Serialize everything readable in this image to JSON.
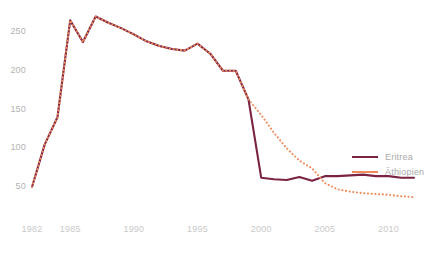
{
  "chart_data": {
    "type": "line",
    "title": "",
    "subtitle": "",
    "xlabel": "",
    "ylabel": "",
    "grid": false,
    "legend_position": "right-inside",
    "x": [
      1982,
      1983,
      1984,
      1985,
      1986,
      1987,
      1988,
      1989,
      1990,
      1991,
      1992,
      1993,
      1994,
      1995,
      1996,
      1997,
      1998,
      1999,
      2000,
      2001,
      2002,
      2003,
      2004,
      2005,
      2006,
      2007,
      2008,
      2009,
      2010,
      2011,
      2012
    ],
    "xlim": [
      1982,
      2012
    ],
    "ylim": [
      30,
      275
    ],
    "xticks": [
      1982,
      1985,
      1990,
      1995,
      2000,
      2005,
      2010
    ],
    "xticklabels": [
      "1982",
      "1985",
      "1990",
      "1995",
      "2000",
      "2005",
      "2010"
    ],
    "yticks": [
      50,
      100,
      150,
      200,
      250
    ],
    "yticklabels": [
      "50",
      "100",
      "150",
      "200",
      "250"
    ],
    "series": [
      {
        "name": "Eritrea",
        "color": "#7B2343",
        "style": "solid",
        "values": [
          50,
          105,
          140,
          265,
          237,
          270,
          262,
          255,
          247,
          238,
          232,
          228,
          226,
          235,
          222,
          200,
          200,
          163,
          62,
          60,
          59,
          63,
          58,
          64,
          64,
          65,
          66,
          64,
          64,
          62,
          62
        ]
      },
      {
        "name": "Äthiopien",
        "color": "#EE8C5E",
        "style": "dotted",
        "values": [
          50,
          105,
          140,
          265,
          237,
          270,
          262,
          255,
          247,
          238,
          232,
          228,
          226,
          235,
          222,
          200,
          200,
          163,
          143,
          120,
          100,
          84,
          74,
          55,
          47,
          44,
          42,
          41,
          40,
          38,
          37
        ]
      }
    ]
  },
  "legend": {
    "items": [
      {
        "label": "Eritrea",
        "color": "#7B2343"
      },
      {
        "label": "Äthiopien",
        "color": "#EE8C5E"
      }
    ]
  },
  "axes": {
    "y_labels": [
      "250",
      "200",
      "150",
      "100",
      "50"
    ],
    "x_labels": [
      "1982",
      "1985",
      "1990",
      "1995",
      "2000",
      "2005",
      "2010"
    ]
  }
}
